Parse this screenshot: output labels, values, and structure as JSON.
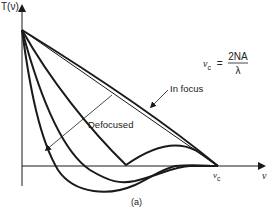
{
  "figure": {
    "y_axis_label": "T(ν)",
    "x_axis_label": "ν",
    "cutoff_label": "ν",
    "cutoff_subscript": "c",
    "formula": {
      "lhs": "ν",
      "lhs_subscript": "c",
      "equals": "=",
      "numerator": "2NA",
      "denominator": "λ"
    },
    "annotation_in_focus": "In focus",
    "annotation_defocused": "Defocused",
    "caption": "(a)"
  },
  "colors": {
    "stroke": "#1a1a1a",
    "text": "#222222",
    "background": "#ffffff"
  }
}
